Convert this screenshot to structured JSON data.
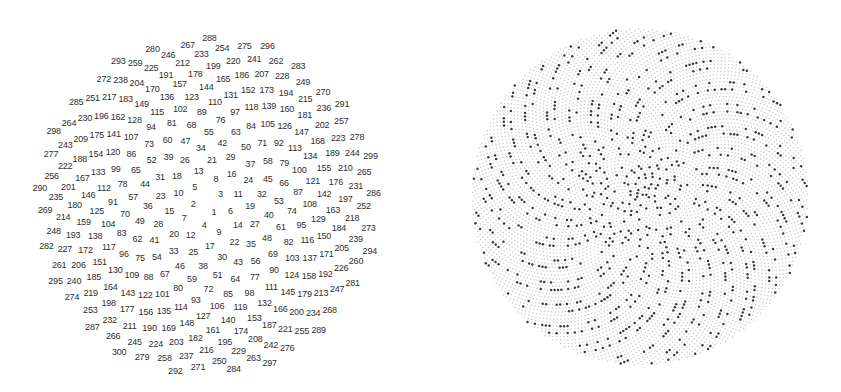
{
  "figure": {
    "type": "phyllotaxis-spiral",
    "golden_angle_deg": 137.508,
    "rotation_offset_deg": 268.5
  },
  "left_panel": {
    "description": "Numbered points 1-300 placed on a Vogel (sunflower) spiral",
    "count": 300,
    "center": [
      207,
      205
    ],
    "scale": 9.87,
    "text_color": "#2e2e2e",
    "font_size_px": 9
  },
  "right_panel": {
    "description": "Dense Vogel spiral of points; highlighted points rendered dark, others faint grey",
    "count": 7000,
    "center": [
      220,
      197
    ],
    "scale": 2.01,
    "highlight_rule": "prime",
    "faint_color": "#c8c8c8",
    "dark_color": "#3a3a3a",
    "faint_radius": 0.75,
    "dark_radius": 1.25
  }
}
